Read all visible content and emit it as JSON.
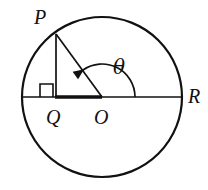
{
  "figure": {
    "background_color": "#ffffff",
    "stroke_color": "#111111"
  },
  "labels": {
    "p": "P",
    "q": "Q",
    "o": "O",
    "r": "R",
    "theta": "θ"
  },
  "geometry": {
    "circle": {
      "center_x": 102,
      "center_y": 97,
      "radius": 80,
      "stroke_width": 2.2
    },
    "points": {
      "P": {
        "x": 56,
        "y": 34
      },
      "Q": {
        "x": 56,
        "y": 97
      },
      "O": {
        "x": 102,
        "y": 97
      },
      "R": {
        "x": 182,
        "y": 97
      }
    },
    "diameter": {
      "x1": 22,
      "y1": 97,
      "x2": 182,
      "y2": 97,
      "stroke_width": 1.6
    },
    "segment_PQ": {
      "x1": 56,
      "y1": 34,
      "x2": 56,
      "y2": 97,
      "stroke_width": 1.7
    },
    "segment_PO": {
      "x1": 56,
      "y1": 34,
      "x2": 102,
      "y2": 97,
      "stroke_width": 1.7
    },
    "segment_QO": {
      "x1": 55,
      "y1": 97,
      "x2": 102,
      "y2": 97,
      "stroke_width": 3.6
    },
    "right_angle_marker": {
      "x": 40,
      "y": 84,
      "size": 13,
      "stroke_width": 1.6
    },
    "theta_arc": {
      "radius": 33,
      "start_angle_deg": 0,
      "end_angle_deg": 126,
      "direction": "counterclockwise",
      "stroke_width": 1.7,
      "arrow_at": "end"
    }
  },
  "label_positions": {
    "p": {
      "x": 40,
      "y": 24,
      "font_size": 20
    },
    "q": {
      "x": 46,
      "y": 124,
      "font_size": 20
    },
    "o": {
      "x": 94,
      "y": 124,
      "font_size": 20
    },
    "r": {
      "x": 188,
      "y": 103,
      "font_size": 20
    },
    "theta": {
      "x": 113,
      "y": 74,
      "font_size": 20
    }
  }
}
